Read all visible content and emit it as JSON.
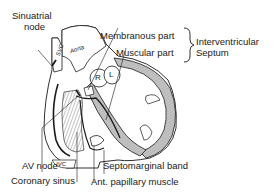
{
  "labels": {
    "sinuatrial_line1": "Sinuatrial",
    "sinuatrial_line2": "node",
    "membranous": "Membranous part",
    "muscular": "Muscular part",
    "septum_line1": "Interventricular",
    "septum_line2": "Septum",
    "av_node": "AV node",
    "coronary_sinus": "Coronary sinus",
    "septomarginal": "Septomarginal band",
    "papillary": "Ant. papillary muscle"
  },
  "structure_labels": {
    "svc": "SVC",
    "aorta": "Aorta",
    "ivc": "IVC",
    "right": "R",
    "left": "L"
  },
  "colors": {
    "ink": "#1a1a1a",
    "band_fill": "#b8b8b8",
    "background": "#ffffff"
  }
}
